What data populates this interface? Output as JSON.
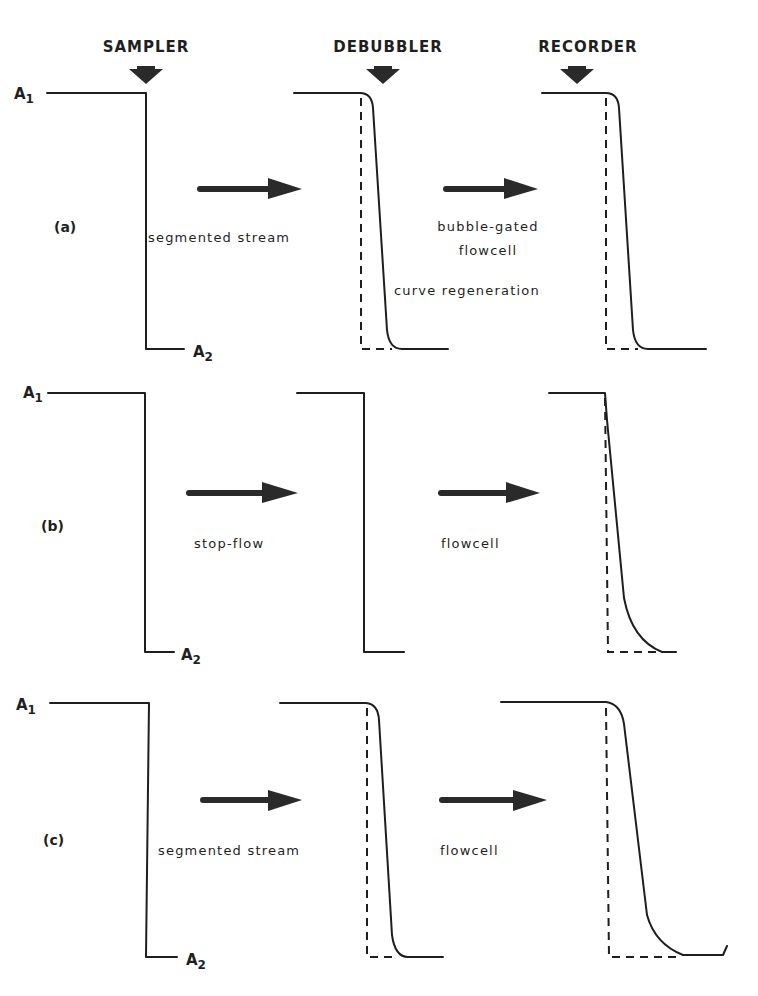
{
  "headers": {
    "sampler": "SAMPLER",
    "debubbler": "DEBUBBLER",
    "recorder": "RECORDER"
  },
  "levels": {
    "a1": "A",
    "a1_sub": "1",
    "a2": "A",
    "a2_sub": "2"
  },
  "panels": [
    {
      "label": "(a)",
      "arrow1_caption": "segmented stream",
      "arrow2_caption_line1": "bubble-gated",
      "arrow2_caption_line2": "flowcell",
      "arrow2_caption_line3": "curve regeneration"
    },
    {
      "label": "(b)",
      "arrow1_caption": "stop-flow",
      "arrow2_caption_line1": "flowcell"
    },
    {
      "label": "(c)",
      "arrow1_caption": "segmented stream",
      "arrow2_caption_line1": "flowcell"
    }
  ],
  "colors": {
    "ink": "#1e1e1e",
    "background": "#ffffff"
  }
}
